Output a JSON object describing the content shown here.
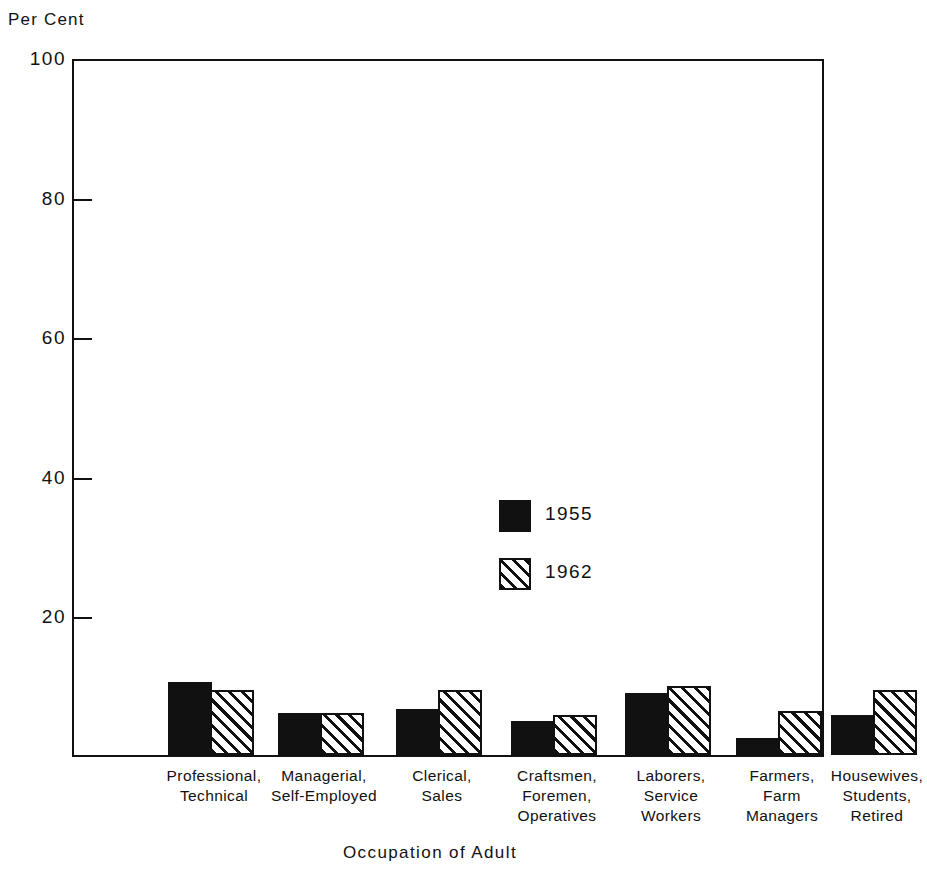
{
  "chart_data": {
    "type": "bar",
    "title": "",
    "xlabel": "Occupation of Adult",
    "ylabel": "Per Cent",
    "ylim": [
      0,
      100
    ],
    "yticks": [
      0,
      20,
      40,
      60,
      80,
      100
    ],
    "ytick_labels": [
      "",
      "20",
      "40",
      "60",
      "80",
      "100"
    ],
    "grid": false,
    "legend_position": "inside-center-right",
    "categories": [
      "Professional, Technical",
      "Managerial, Self-Employed",
      "Clerical, Sales",
      "Craftsmen, Foremen, Operatives",
      "Laborers, Service Workers",
      "Farmers, Farm Managers",
      "Housewives, Students, Retired"
    ],
    "category_lines": [
      [
        "Professional,",
        "Technical"
      ],
      [
        "Managerial,",
        "Self-Employed"
      ],
      [
        "Clerical,",
        "Sales"
      ],
      [
        "Craftsmen,",
        "Foremen,",
        "Operatives"
      ],
      [
        "Laborers,",
        "Service",
        "Workers"
      ],
      [
        "Farmers,",
        "Farm",
        "Managers"
      ],
      [
        "Housewives,",
        "Students,",
        "Retired"
      ]
    ],
    "series": [
      {
        "name": "1955",
        "style": "solid-black",
        "values": [
          10.5,
          6.1,
          6.7,
          4.9,
          9.0,
          2.4,
          5.7
        ]
      },
      {
        "name": "1962",
        "style": "hatched",
        "values": [
          9.3,
          6.1,
          9.3,
          5.7,
          10.0,
          6.3,
          9.3
        ]
      }
    ]
  },
  "axis": {
    "y_unit_caption": "Per Cent",
    "x_axis_title": "Occupation of Adult"
  },
  "legend": {
    "entries": [
      {
        "label": "1955",
        "style": "solid"
      },
      {
        "label": "1962",
        "style": "hatch"
      }
    ]
  },
  "colors": {
    "ink": "#111111",
    "paper": "#ffffff"
  },
  "layout": {
    "plot": {
      "left": 72,
      "top": 59,
      "width": 752,
      "height": 698
    },
    "bars_left": 74,
    "bars_width": 748,
    "baseline_y": 755,
    "group_centers_px": [
      140,
      250,
      368,
      483,
      597,
      708,
      803
    ],
    "bar_width_px": 44,
    "px_per_unit": 6.96
  }
}
